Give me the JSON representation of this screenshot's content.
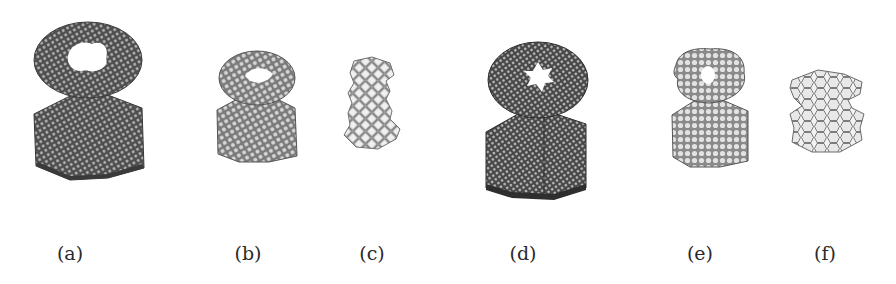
{
  "figure": {
    "panels": [
      {
        "id": "a",
        "label": "(a)",
        "label_x": 70,
        "style": "dense-dark",
        "hole": "irregular"
      },
      {
        "id": "b",
        "label": "(b)",
        "label_x": 248,
        "style": "medium-gray",
        "hole": "lens"
      },
      {
        "id": "c",
        "label": "(c)",
        "label_x": 372,
        "style": "light-lattice",
        "hole": "none"
      },
      {
        "id": "d",
        "label": "(d)",
        "label_x": 523,
        "style": "dense-dark",
        "hole": "star"
      },
      {
        "id": "e",
        "label": "(e)",
        "label_x": 700,
        "style": "medium-gray",
        "hole": "round"
      },
      {
        "id": "f",
        "label": "(f)",
        "label_x": 825,
        "style": "light-lattice",
        "hole": "none"
      }
    ],
    "colors": {
      "dark_fill": "#5a5a5a",
      "medium_fill": "#8e8e8e",
      "light_fill": "#e6e6e6",
      "stroke": "#3c3c3c",
      "background": "#ffffff",
      "caption": "#2a2a2a"
    }
  }
}
